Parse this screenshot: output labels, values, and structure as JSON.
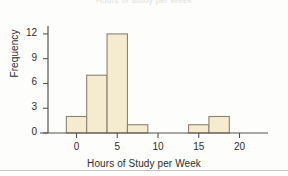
{
  "figure": {
    "title_ghost": "Hours of Study per Week",
    "background_color": "#fdfdfb",
    "bar_fill_color": "#f5ecd0",
    "bar_stroke_color": "#8a8274",
    "axis_color": "#555550",
    "text_color": "#2e2e2e"
  },
  "chart_data": {
    "type": "bar",
    "title": "",
    "xlabel": "Hours of Study per Week",
    "ylabel": "Frequency",
    "xlim": [
      -3.5,
      23.5
    ],
    "ylim": [
      0,
      13.2
    ],
    "xticks": [
      0,
      5,
      10,
      15,
      20
    ],
    "xtick_labels": [
      "0",
      "5",
      "10",
      "15",
      "20"
    ],
    "yticks": [
      0,
      3,
      6,
      9,
      12
    ],
    "ytick_labels": [
      "0",
      "3",
      "6",
      "9",
      "12"
    ],
    "grid": false,
    "legend": false,
    "bin_width": 2.5,
    "bins": [
      {
        "left": -1.25,
        "right": 1.25,
        "value": 2
      },
      {
        "left": 1.25,
        "right": 3.75,
        "value": 7
      },
      {
        "left": 3.75,
        "right": 6.25,
        "value": 12
      },
      {
        "left": 6.25,
        "right": 8.75,
        "value": 1
      },
      {
        "left": 8.75,
        "right": 11.25,
        "value": 0
      },
      {
        "left": 11.25,
        "right": 13.75,
        "value": 0
      },
      {
        "left": 13.75,
        "right": 16.25,
        "value": 1
      },
      {
        "left": 16.25,
        "right": 18.75,
        "value": 2
      },
      {
        "left": 18.75,
        "right": 21.25,
        "value": 0
      }
    ],
    "categories": [
      "0",
      "2.5",
      "5",
      "7.5",
      "10",
      "12.5",
      "15",
      "17.5",
      "20"
    ],
    "values": [
      2,
      7,
      12,
      1,
      0,
      0,
      1,
      2,
      0
    ]
  }
}
